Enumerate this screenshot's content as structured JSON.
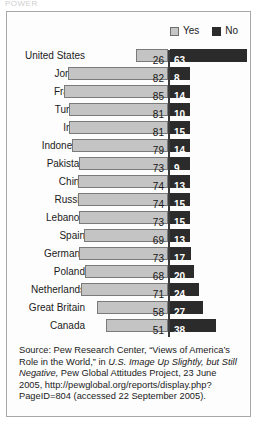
{
  "top_fragment": "POWER",
  "legend": {
    "items": [
      {
        "label": "Yes",
        "swatch": "light-gray-square",
        "color": "#c6c6c6"
      },
      {
        "label": "No",
        "swatch": "dark-square",
        "color": "#2b2b2b"
      }
    ]
  },
  "chart_data": {
    "type": "bar",
    "orientation": "horizontal-diverging",
    "title": "",
    "xlabel": "",
    "ylabel": "",
    "grid": false,
    "legend_position": "top-right",
    "axis_zero_line": true,
    "categories": [
      "United States",
      "Jordan",
      "France",
      "Turkey",
      "India",
      "Indonesia",
      "Pakistan",
      "China",
      "Russia",
      "Lebanon",
      "Spain",
      "Germany",
      "Poland",
      "Netherlands",
      "Great Britain",
      "Canada"
    ],
    "series": [
      {
        "name": "Yes",
        "color": "#c6c6c6",
        "values": [
          26,
          82,
          85,
          81,
          81,
          79,
          73,
          74,
          74,
          73,
          69,
          73,
          68,
          71,
          58,
          51
        ]
      },
      {
        "name": "No",
        "color": "#2b2b2b",
        "values": [
          63,
          8,
          14,
          10,
          15,
          14,
          9,
          13,
          15,
          15,
          13,
          17,
          20,
          24,
          27,
          38
        ]
      }
    ]
  },
  "source": {
    "prefix": "Source: Pew Research Center, “Views of America’s Role in the World,” in ",
    "italic_title": "U.S. Image Up Slightly, but Still Negative,",
    "suffix": " Pew Global Attitudes Project, 23 June 2005, http://pewglobal.org/reports/display.php?PageID=804 (accessed 22 September 2005)."
  }
}
